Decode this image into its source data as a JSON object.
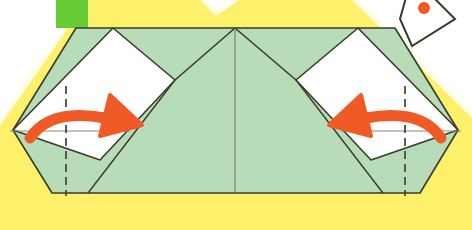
{
  "diagram": {
    "title": "Origami fold step",
    "canvas": {
      "width": 472,
      "height": 230
    },
    "colors": {
      "background": "#ffffff",
      "paper_green_front": "#b9dcb8",
      "paper_white_back": "#ffffff",
      "highlight_yellow": "#fdf06a",
      "highlight_yellow_soft": "#fff9b0",
      "swatch_green": "#66cc33",
      "arrow_orange": "#f05a28",
      "outline_dark": "#3a3a28",
      "fold_line": "#555544",
      "crease_line": "#8a8a78"
    },
    "shapes": {
      "highlight_band": {
        "name": "yellow-highlight-frame",
        "label": "Yellow highlight band surrounding the model",
        "points": "88,0 200,0 216,16 240,0 352,0 472,118 472,230 0,230 0,126"
      },
      "swatch": {
        "name": "green-color-swatch",
        "label": "Green color swatch",
        "x": 56,
        "y": 0,
        "width": 32,
        "height": 28
      },
      "hexagon": {
        "name": "folded-paper-hexagon",
        "label": "Main folded paper outline (hexagon)",
        "points": "13,130 76,28 395,28 458,130 420,193 52,193"
      },
      "center_apex": {
        "x": 235,
        "y": 28
      },
      "center_line": {
        "x": 235,
        "y1": 28,
        "y2": 193
      },
      "left_flap": {
        "name": "left-white-flap",
        "label": "Left white triangular flap",
        "points": "13,130 113,28 175,80 100,160"
      },
      "right_flap": {
        "name": "right-white-flap",
        "label": "Right white triangular flap",
        "points": "458,130 358,28 296,80 371,160"
      }
    },
    "fold_lines": [
      {
        "name": "left-valley-fold",
        "label": "Left vertical valley fold line",
        "x": 66,
        "y1": 86,
        "y2": 196
      },
      {
        "name": "right-valley-fold",
        "label": "Right vertical valley fold line",
        "x": 405,
        "y1": 86,
        "y2": 196
      }
    ],
    "crease_lines": [
      {
        "name": "left-horizontal-crease",
        "label": "Left horizontal reference crease",
        "x1": 10,
        "y1": 131,
        "x2": 130,
        "y2": 131
      },
      {
        "name": "right-horizontal-crease",
        "label": "Right horizontal reference crease",
        "x1": 341,
        "y1": 131,
        "x2": 461,
        "y2": 131
      }
    ],
    "arrows": [
      {
        "name": "left-fold-arrow",
        "label": "Curved fold arrow pointing right",
        "direction": "right",
        "tail": "30,138",
        "curve": "M 30,138 Q 50,108 105,118",
        "head": "110,95 142,125 100,136"
      },
      {
        "name": "right-fold-arrow",
        "label": "Curved fold arrow pointing left",
        "direction": "left",
        "tail": "441,138",
        "curve": "M 441,138 Q 421,108 366,118",
        "head": "361,95 329,125 371,136"
      }
    ],
    "thumbnail": {
      "name": "next-step-thumbnail",
      "label": "Partially visible next-step diamond thumbnail at top right",
      "points": "412,-24 455,19 412,46 400,19",
      "mark": {
        "cx": 424,
        "cy": 8,
        "r": 6
      }
    }
  }
}
